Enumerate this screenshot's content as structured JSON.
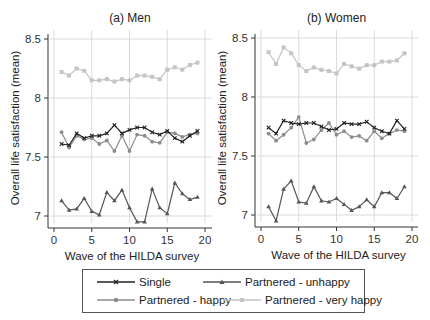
{
  "chart_data": [
    {
      "type": "line",
      "title": "(a) Men",
      "xlabel": "Wave of the HILDA survey",
      "ylabel": "Overall life satisfaction (mean)",
      "xlim": [
        0,
        20
      ],
      "ylim": [
        6.95,
        8.55
      ],
      "xticks": [
        0,
        5,
        10,
        15,
        20
      ],
      "yticks": [
        7,
        7.5,
        8,
        8.5
      ],
      "ytick_labels": [
        "7",
        "7.5",
        "8",
        "8.5"
      ],
      "grid": true,
      "x": [
        1,
        2,
        3,
        4,
        5,
        6,
        7,
        8,
        9,
        10,
        11,
        12,
        13,
        14,
        15,
        16,
        17,
        18,
        19
      ],
      "series": [
        {
          "name": "Single",
          "values": [
            7.61,
            7.6,
            7.7,
            7.66,
            7.68,
            7.68,
            7.7,
            7.77,
            7.7,
            7.73,
            7.75,
            7.75,
            7.71,
            7.69,
            7.72,
            7.66,
            7.63,
            7.68,
            7.72
          ]
        },
        {
          "name": "Partnered - unhappy",
          "values": [
            7.13,
            7.05,
            7.06,
            7.15,
            7.04,
            7.01,
            7.2,
            7.13,
            7.22,
            7.07,
            6.95,
            6.95,
            7.23,
            7.07,
            7.02,
            7.28,
            7.19,
            7.14,
            7.16
          ]
        },
        {
          "name": "Partnered - happy",
          "values": [
            7.71,
            7.58,
            7.68,
            7.65,
            7.66,
            7.61,
            7.64,
            7.55,
            7.68,
            7.55,
            7.69,
            7.68,
            7.63,
            7.62,
            7.71,
            7.7,
            7.67,
            7.69,
            7.7
          ]
        },
        {
          "name": "Partnered - very happy",
          "values": [
            8.22,
            8.19,
            8.25,
            8.23,
            8.15,
            8.15,
            8.16,
            8.14,
            8.16,
            8.15,
            8.19,
            8.19,
            8.18,
            8.16,
            8.24,
            8.26,
            8.24,
            8.28,
            8.3
          ]
        }
      ]
    },
    {
      "type": "line",
      "title": "(b) Women",
      "xlabel": "Wave of the HILDA survey",
      "ylabel": "Overall life satisfaction (mean)",
      "xlim": [
        0,
        20
      ],
      "ylim": [
        6.95,
        8.55
      ],
      "xticks": [
        0,
        5,
        10,
        15,
        20
      ],
      "yticks": [
        7,
        7.5,
        8,
        8.5
      ],
      "ytick_labels": [
        "7",
        "7.5",
        "8",
        "8.5"
      ],
      "grid": true,
      "x": [
        1,
        2,
        3,
        4,
        5,
        6,
        7,
        8,
        9,
        10,
        11,
        12,
        13,
        14,
        15,
        16,
        17,
        18,
        19
      ],
      "series": [
        {
          "name": "Single",
          "values": [
            7.74,
            7.69,
            7.8,
            7.78,
            7.77,
            7.78,
            7.78,
            7.75,
            7.72,
            7.73,
            7.78,
            7.77,
            7.77,
            7.79,
            7.74,
            7.71,
            7.69,
            7.8,
            7.73
          ]
        },
        {
          "name": "Partnered - unhappy",
          "values": [
            7.07,
            6.95,
            7.22,
            7.29,
            7.11,
            7.1,
            7.24,
            7.12,
            7.11,
            7.14,
            7.09,
            7.04,
            7.07,
            7.13,
            7.07,
            7.19,
            7.19,
            7.14,
            7.24
          ]
        },
        {
          "name": "Partnered - happy",
          "values": [
            7.69,
            7.63,
            7.68,
            7.74,
            7.83,
            7.61,
            7.64,
            7.72,
            7.78,
            7.68,
            7.71,
            7.66,
            7.67,
            7.63,
            7.71,
            7.65,
            7.69,
            7.72,
            7.71
          ]
        },
        {
          "name": "Partnered - very happy",
          "values": [
            8.38,
            8.28,
            8.42,
            8.37,
            8.27,
            8.22,
            8.25,
            8.23,
            8.22,
            8.2,
            8.28,
            8.26,
            8.24,
            8.27,
            8.27,
            8.3,
            8.3,
            8.31,
            8.37
          ]
        }
      ]
    }
  ],
  "legend": {
    "entries": [
      {
        "label": "Single",
        "color": "#222222",
        "marker": "x"
      },
      {
        "label": "Partnered - unhappy",
        "color": "#555555",
        "marker": "triangle"
      },
      {
        "label": "Partnered - happy",
        "color": "#8c8c8c",
        "marker": "circle"
      },
      {
        "label": "Partnered - very happy",
        "color": "#c4c4c4",
        "marker": "square"
      }
    ]
  }
}
